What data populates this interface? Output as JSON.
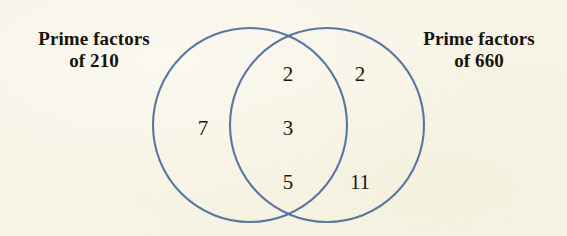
{
  "figure": {
    "type": "venn-diagram",
    "background_color": "#f7f4e6",
    "circle_stroke_color": "#4a6b9a",
    "text_color": "#16130f",
    "width": 567,
    "height": 236
  },
  "sets": {
    "left": {
      "label_line_1": "Prime factors",
      "label_line_2": "of 210",
      "center_x": 250,
      "center_y": 125,
      "radius": 97
    },
    "right": {
      "label_line_1": "Prime factors",
      "label_line_2": "of 660",
      "center_x": 327,
      "center_y": 125,
      "radius": 97
    }
  },
  "regions": {
    "left_only": {
      "name": "prime-factors-of-210-only",
      "values": [
        "7"
      ]
    },
    "intersection": {
      "name": "common-prime-factors",
      "values": [
        "2",
        "3",
        "5"
      ]
    },
    "right_only": {
      "name": "prime-factors-of-660-only",
      "values": [
        "2",
        "11"
      ]
    }
  }
}
